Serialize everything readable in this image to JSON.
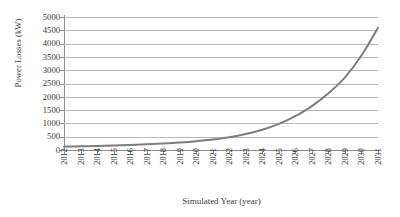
{
  "chart_data": {
    "type": "line",
    "title": "",
    "xlabel": "Simulated Year (year)",
    "ylabel": "Power Losses (kW)",
    "categories": [
      "2012",
      "2013",
      "2014",
      "2015",
      "2016",
      "2017",
      "2018",
      "2019",
      "2020",
      "2021",
      "2022",
      "2023",
      "2024",
      "2025",
      "2026",
      "2027",
      "2028",
      "2029",
      "2030",
      "2031"
    ],
    "values": [
      130,
      140,
      152,
      168,
      188,
      212,
      242,
      280,
      330,
      395,
      480,
      600,
      760,
      980,
      1270,
      1650,
      2130,
      2730,
      3550,
      4600
    ],
    "series": [
      {
        "name": "Power Losses",
        "color": "#7d7d7d",
        "values": [
          130,
          140,
          152,
          168,
          188,
          212,
          242,
          280,
          330,
          395,
          480,
          600,
          760,
          980,
          1270,
          1650,
          2130,
          2730,
          3550,
          4600
        ]
      }
    ],
    "ylim": [
      0,
      5000
    ],
    "yticks": [
      0,
      500,
      1000,
      1500,
      2000,
      2500,
      3000,
      3500,
      4000,
      4500,
      5000
    ],
    "ytick_labels": [
      "0",
      "500",
      "1000",
      "1500",
      "2000",
      "2500",
      "3000",
      "3500",
      "4000",
      "4500",
      "5000"
    ],
    "grid": true,
    "grid_axis": "y",
    "legend": false,
    "legend_position": "none",
    "marker": "none",
    "line_width": 2,
    "colors": {
      "line": "#7d7d7d",
      "grid": "#b9b9b9",
      "axis": "#8e8e8e",
      "text": "#3a3a3a",
      "background": "#ffffff"
    }
  }
}
